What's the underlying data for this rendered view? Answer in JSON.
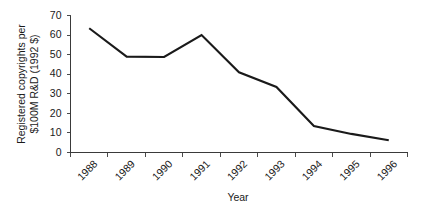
{
  "chart_data": {
    "type": "line",
    "title": "",
    "xlabel": "Year",
    "ylabel": "Registered copyrights per $100M R&D (1992 $)",
    "categories": [
      "1988",
      "1989",
      "1990",
      "1991",
      "1992",
      "1993",
      "1994",
      "1995",
      "1996"
    ],
    "values": [
      63.5,
      49,
      48.8,
      60,
      41,
      33.5,
      13.5,
      9.5,
      6.3
    ],
    "series": [
      {
        "name": "Registered copyrights per $100M R&D (1992 $)",
        "values": [
          63.5,
          49,
          48.8,
          60,
          41,
          33.5,
          13.5,
          9.5,
          6.3
        ]
      }
    ],
    "ylim": [
      0,
      70
    ],
    "yticks": [
      "0",
      "10",
      "20",
      "30",
      "40",
      "50",
      "60",
      "70"
    ],
    "ytick_values": [
      0,
      10,
      20,
      30,
      40,
      50,
      60,
      70
    ],
    "grid": false,
    "legend": false,
    "legend_position": "none",
    "line_color": "#1a1a1a",
    "axis_color": "#3a3a3a",
    "background_color": "#ffffff",
    "xtick_rotation_degrees": -45
  }
}
